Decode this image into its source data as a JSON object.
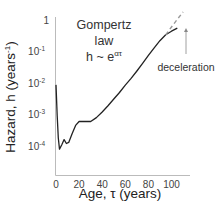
{
  "chart_data": {
    "type": "line",
    "title": "",
    "xlabel": "Age, τ (years)",
    "ylabel": "Hazard, h (years⁻¹)",
    "yscale": "log",
    "xlim": [
      0,
      115
    ],
    "ylim": [
      1e-05,
      1
    ],
    "grid": false,
    "legend": null,
    "x_ticks": [
      0,
      20,
      40,
      60,
      80,
      100
    ],
    "x_tick_labels": [
      "0",
      "20",
      "40",
      "60",
      "80",
      "100"
    ],
    "y_ticks": [
      1,
      0.1,
      0.01,
      0.001,
      0.0001
    ],
    "y_tick_labels": [
      {
        "base": "1",
        "exp": ""
      },
      {
        "base": "10",
        "exp": "-1"
      },
      {
        "base": "10",
        "exp": "-2"
      },
      {
        "base": "10",
        "exp": "-3"
      },
      {
        "base": "10",
        "exp": "-4"
      }
    ],
    "series": [
      {
        "name": "observed hazard",
        "style": "solid",
        "color": "#222222",
        "x": [
          0,
          1,
          2,
          3,
          5,
          7,
          9,
          11,
          14,
          17,
          20,
          25,
          30,
          35,
          40,
          45,
          50,
          55,
          60,
          65,
          70,
          75,
          80,
          85,
          90,
          95,
          100,
          105
        ],
        "y": [
          0.0087,
          0.0009,
          0.00018,
          8e-05,
          0.00011,
          0.00016,
          0.00012,
          0.00013,
          0.00025,
          0.00045,
          0.0006,
          0.0006,
          0.0006,
          0.0008,
          0.0012,
          0.0019,
          0.0031,
          0.005,
          0.0085,
          0.014,
          0.024,
          0.042,
          0.075,
          0.13,
          0.22,
          0.34,
          0.44,
          0.55
        ]
      },
      {
        "name": "Gompertz extrapolation",
        "style": "dashed",
        "color": "#999999",
        "x": [
          95,
          100,
          105,
          110
        ],
        "y": [
          0.34,
          0.6,
          1.05,
          1.8
        ]
      }
    ],
    "annotations": [
      {
        "text_lines": [
          "Gompertz",
          "law"
        ],
        "formula": {
          "base": "h ~ e",
          "exp": "ατ"
        }
      },
      {
        "text": "deceleration",
        "arrow_to_x": 104,
        "arrow_to_y": 0.55
      }
    ]
  },
  "labels": {
    "gompertz_line1": "Gompertz",
    "gompertz_line2": "law",
    "formula_base": "h ~ e",
    "formula_exp": "ατ",
    "deceleration": "deceleration",
    "xlabel": "Age, τ (years)",
    "ylabel_main": "Hazard, h (years",
    "ylabel_exp": "-1",
    "ylabel_close": ")"
  }
}
